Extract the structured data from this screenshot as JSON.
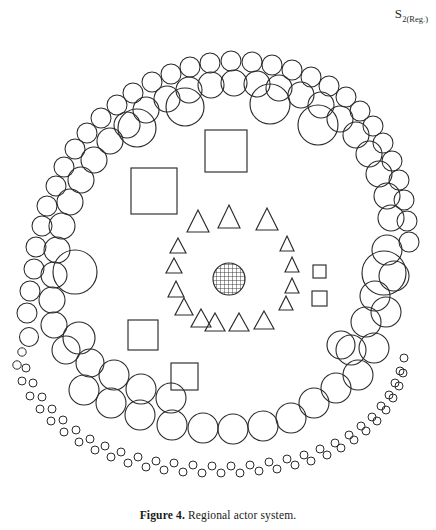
{
  "figure": {
    "corner_label_main": "S",
    "corner_label_sub": "2(Reg.)",
    "caption_number": "Figure 4.",
    "caption_text": "Regional actor system.",
    "background_color": "#ffffff",
    "stroke_color": "#2b2b2b"
  },
  "diagram": {
    "type": "concentric-actor-system",
    "center": {
      "cx": 229,
      "cy": 279
    },
    "core": {
      "name": "core-hatched-circle",
      "cx": 229,
      "cy": 279,
      "r": 16,
      "fill_pattern": "cross-hatch-grid",
      "description": "central hatched circle representing the core actor"
    },
    "rings": [
      {
        "name": "triangle-ring",
        "shape": "triangle",
        "count": 19,
        "radius": 52,
        "sizes": "mixed small and large triangles",
        "items": [
          {
            "cx": 229,
            "cy": 218,
            "size": 22
          },
          {
            "cx": 268,
            "cy": 221,
            "size": 21
          },
          {
            "cx": 197,
            "cy": 222,
            "size": 20
          },
          {
            "cx": 286,
            "cy": 243,
            "size": 11
          },
          {
            "cx": 177,
            "cy": 245,
            "size": 11
          },
          {
            "cx": 292,
            "cy": 263,
            "size": 11
          },
          {
            "cx": 173,
            "cy": 265,
            "size": 11
          },
          {
            "cx": 292,
            "cy": 283,
            "size": 11
          },
          {
            "cx": 175,
            "cy": 287,
            "size": 12
          },
          {
            "cx": 286,
            "cy": 301,
            "size": 10
          },
          {
            "cx": 183,
            "cy": 305,
            "size": 12
          },
          {
            "cx": 263,
            "cy": 323,
            "size": 14
          },
          {
            "cx": 199,
            "cy": 318,
            "size": 13
          },
          {
            "cx": 238,
            "cy": 328,
            "size": 14
          },
          {
            "cx": 214,
            "cy": 328,
            "size": 13
          }
        ]
      },
      {
        "name": "square-ring",
        "shape": "square",
        "count": 6,
        "items": [
          {
            "x": 205,
            "y": 130,
            "size": 42,
            "label": "large-square-top"
          },
          {
            "x": 131,
            "y": 168,
            "size": 46,
            "label": "large-square-upper-left"
          },
          {
            "x": 128,
            "y": 320,
            "size": 30,
            "label": "medium-square-lower-left"
          },
          {
            "x": 171,
            "y": 363,
            "size": 27,
            "label": "medium-square-bottom"
          },
          {
            "x": 313,
            "y": 265,
            "size": 13,
            "label": "small-square-right-upper"
          },
          {
            "x": 312,
            "y": 291,
            "size": 15,
            "label": "small-square-right-lower"
          }
        ]
      },
      {
        "name": "large-circle-ring",
        "shape": "circle",
        "count": 8,
        "radius_range": "20-24",
        "description": "ring of eight large open circles"
      },
      {
        "name": "medium-circle-ring",
        "shape": "circle",
        "count": 30,
        "radius_range": "13-17",
        "description": "dense ring of medium open circles"
      },
      {
        "name": "small-circle-ring",
        "shape": "circle",
        "count": 36,
        "radius_range": "9-12",
        "description": "outer ring of small open circles"
      },
      {
        "name": "tiny-circle-ring",
        "shape": "circle",
        "count": 56,
        "radius_range": "3-5",
        "description": "outermost double arc of tiny circles along the lower half"
      }
    ]
  }
}
